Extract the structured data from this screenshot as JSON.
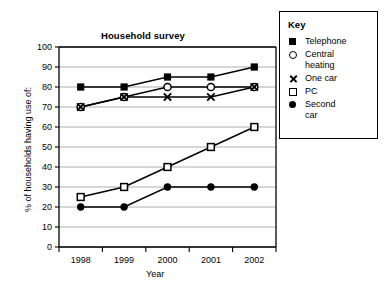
{
  "chart_data": {
    "type": "line",
    "title": "Household survey",
    "xlabel": "Year",
    "ylabel": "% of households having use of:",
    "categories": [
      "1998",
      "1999",
      "2000",
      "2001",
      "2002"
    ],
    "x": [
      1998,
      1999,
      2000,
      2001,
      2002
    ],
    "ylim": [
      0,
      100
    ],
    "ytick_step": 10,
    "yticks": [
      "100",
      "90",
      "80",
      "70",
      "60",
      "50",
      "40",
      "30",
      "20",
      "10",
      "0"
    ],
    "grid": "horizontal",
    "legend_position": "right-outside",
    "legend_title": "Key",
    "series": [
      {
        "name": "Telephone",
        "marker": "filled-square",
        "values": [
          80,
          80,
          85,
          85,
          90
        ]
      },
      {
        "name": "Central heating",
        "marker": "open-circle",
        "values": [
          70,
          75,
          80,
          80,
          80
        ]
      },
      {
        "name": "One car",
        "marker": "cross",
        "values": [
          70,
          75,
          75,
          75,
          80
        ]
      },
      {
        "name": "PC",
        "marker": "open-square",
        "values": [
          25,
          30,
          40,
          50,
          60
        ]
      },
      {
        "name": "Second car",
        "marker": "filled-circle",
        "values": [
          20,
          20,
          30,
          30,
          30
        ]
      }
    ]
  },
  "legend": {
    "title": "Key",
    "items": [
      {
        "label": "Telephone",
        "marker": "filled-square"
      },
      {
        "label": "Central heating",
        "marker": "open-circle"
      },
      {
        "label": "One car",
        "marker": "cross"
      },
      {
        "label": "PC",
        "marker": "open-square"
      },
      {
        "label": "Second car",
        "marker": "filled-circle"
      }
    ]
  },
  "colors": {
    "ink": "#000000",
    "grid": "#999999",
    "background": "#ffffff"
  }
}
